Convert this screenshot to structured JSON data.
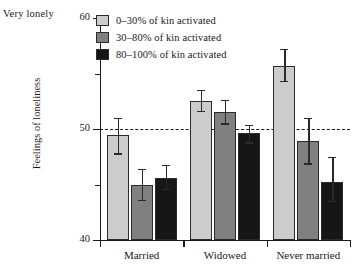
{
  "annotation": {
    "top_left": "Very lonely"
  },
  "legend": {
    "position": "top-left-inside",
    "entries": [
      {
        "label": "0–30% of kin activated",
        "color": "#cccccc"
      },
      {
        "label": "30–80% of kin activated",
        "color": "#808080"
      },
      {
        "label": "80–100% of kin activated",
        "color": "#161616"
      }
    ]
  },
  "axes": {
    "y_title": "Feelings of loneliness",
    "y_ticks": [
      "40",
      "50",
      "60"
    ],
    "x_ticks": [
      "Married",
      "Widowed",
      "Never married"
    ]
  },
  "chart_data": {
    "type": "bar",
    "title": "",
    "xlabel": "",
    "ylabel": "Feelings of loneliness",
    "categories": [
      "Married",
      "Widowed",
      "Never married"
    ],
    "ylim": [
      40,
      60
    ],
    "yticks": [
      40,
      45,
      50,
      55,
      60
    ],
    "ytick_labels": [
      "40",
      "",
      "50",
      "",
      "60"
    ],
    "grid": false,
    "legend_position": "upper left",
    "reference_line": {
      "y": 50,
      "style": "dashed",
      "color": "#1a1a1a"
    },
    "annotations": [
      {
        "text": "Very lonely",
        "position": "above-y-axis-top-left"
      }
    ],
    "series": [
      {
        "name": "0–30% of kin activated",
        "color": "#cccccc",
        "values": [
          49.5,
          52.5,
          55.7
        ],
        "error_low": [
          47.8,
          51.6,
          54.3
        ],
        "error_high": [
          51.0,
          53.5,
          57.2
        ]
      },
      {
        "name": "30–80% of kin activated",
        "color": "#808080",
        "values": [
          45.0,
          51.5,
          48.9
        ],
        "error_low": [
          43.6,
          50.5,
          46.9
        ],
        "error_high": [
          46.4,
          52.6,
          51.0
        ]
      },
      {
        "name": "80–100% of kin activated",
        "color": "#161616",
        "values": [
          45.6,
          49.6,
          45.2
        ],
        "error_low": [
          44.6,
          48.8,
          43.5
        ],
        "error_high": [
          46.8,
          50.4,
          47.5
        ]
      }
    ]
  }
}
